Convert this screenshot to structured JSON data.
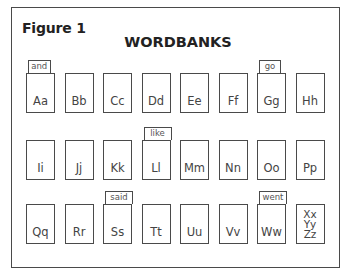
{
  "figure_label": "Figure 1",
  "title": "WORDBANKS",
  "rows": [
    [
      {
        "letters": "Aa",
        "word": "and"
      },
      {
        "letters": "Bb",
        "word": null
      },
      {
        "letters": "Cc",
        "word": null
      },
      {
        "letters": "Dd",
        "word": null
      },
      {
        "letters": "Ee",
        "word": null
      },
      {
        "letters": "Ff",
        "word": null
      },
      {
        "letters": "Gg",
        "word": "go"
      },
      {
        "letters": "Hh",
        "word": null
      }
    ],
    [
      {
        "letters": "Ii",
        "word": null
      },
      {
        "letters": "Jj",
        "word": null
      },
      {
        "letters": "Kk",
        "word": null
      },
      {
        "letters": "Ll",
        "word": "like"
      },
      {
        "letters": "Mm",
        "word": null
      },
      {
        "letters": "Nn",
        "word": null
      },
      {
        "letters": "Oo",
        "word": null
      },
      {
        "letters": "Pp",
        "word": null
      }
    ],
    [
      {
        "letters": "Qq",
        "word": null
      },
      {
        "letters": "Rr",
        "word": null
      },
      {
        "letters": "Ss",
        "word": "said"
      },
      {
        "letters": "Tt",
        "word": null
      },
      {
        "letters": "Uu",
        "word": null
      },
      {
        "letters": "Vv",
        "word": null
      },
      {
        "letters": "Ww",
        "word": "went"
      },
      {
        "letters": "Xx Yy Zz",
        "word": null
      }
    ]
  ]
}
